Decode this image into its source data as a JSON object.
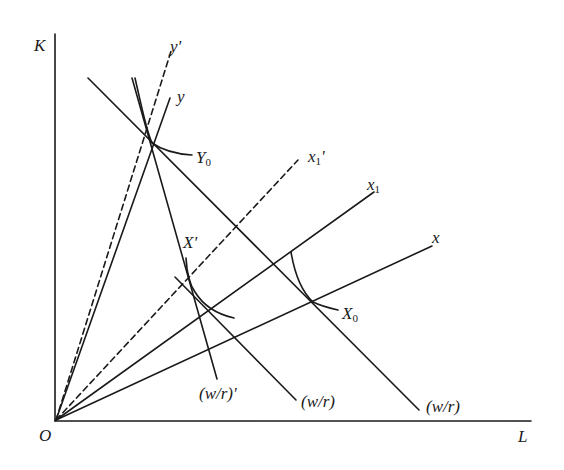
{
  "axes": {
    "y_label": "K",
    "x_label": "L",
    "origin_label": "O"
  },
  "rays": [
    {
      "name": "y-prime",
      "label": "y'",
      "style": "dashed"
    },
    {
      "name": "y",
      "label": "y",
      "style": "solid"
    },
    {
      "name": "x1-prime",
      "label": "x",
      "sub": "1",
      "suffix": "'",
      "style": "dashed"
    },
    {
      "name": "x1",
      "label": "x",
      "sub": "1",
      "style": "solid"
    },
    {
      "name": "x",
      "label": "x",
      "style": "solid"
    }
  ],
  "price_lines": [
    {
      "name": "wr-prime",
      "label": "(w/r)'"
    },
    {
      "name": "wr-middle",
      "label": "(w/r)"
    },
    {
      "name": "wr-outer",
      "label": "(w/r)"
    }
  ],
  "isoquants": [
    {
      "name": "Y0",
      "label": "Y",
      "sub": "0"
    },
    {
      "name": "X0",
      "label": "X",
      "sub": "0"
    },
    {
      "name": "X-prime",
      "label": "X'"
    }
  ],
  "colors": {
    "line": "#1a1a1a",
    "background": "#ffffff"
  }
}
